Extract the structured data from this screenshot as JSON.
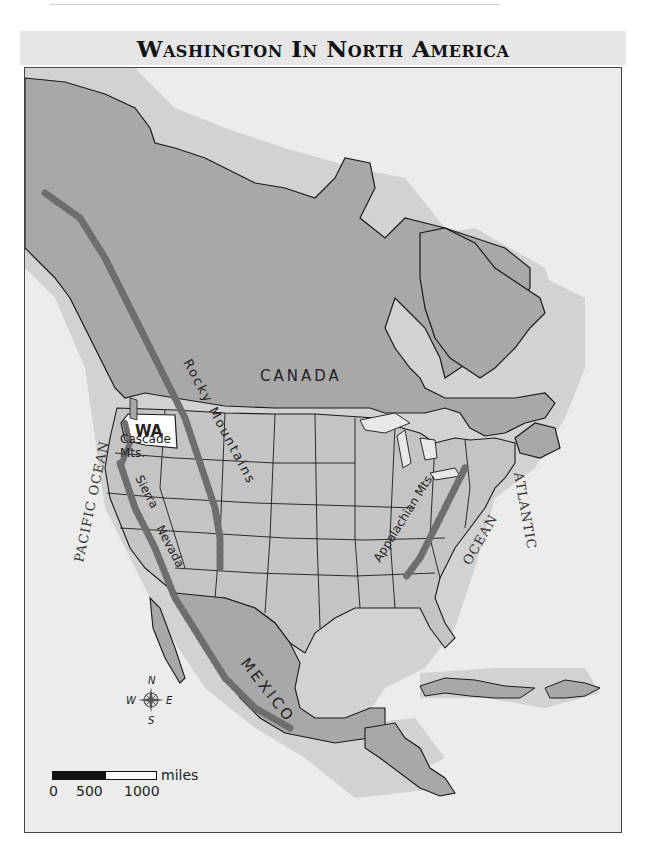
{
  "title": "Washington In North America",
  "colors": {
    "land_canada_mexico": "#a8a8a8",
    "land_us": "#c4c4c4",
    "washington_highlight": "#ffffff",
    "mountains": "#6e6e6e",
    "shallow_water": "#cfcfcf",
    "deep_water": "#ececec",
    "borders": "#1a1a1a"
  },
  "labels": {
    "canada": "CANADA",
    "mexico": "MEXICO",
    "washington": "WA",
    "rocky_mountains": "Rocky Mountains",
    "cascade_line1": "Cascade",
    "cascade_line2": "Mts.",
    "sierra": "Sierra",
    "nevada": "Nevada",
    "appalachian": "Appalachian Mts.",
    "pacific_ocean": "PACIFIC OCEAN",
    "atlantic": "ATLANTIC",
    "ocean": "OCEAN"
  },
  "compass": {
    "icon": "compass-rose-icon",
    "n": "N",
    "s": "S",
    "e": "E",
    "w": "W"
  },
  "scale": {
    "unit": "miles",
    "ticks": [
      "0",
      "500",
      "1000"
    ]
  }
}
